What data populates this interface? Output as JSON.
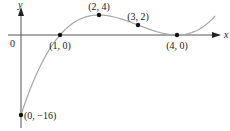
{
  "chart_data": {
    "type": "line",
    "title": "",
    "xlabel": "x",
    "ylabel": "y",
    "function": "f(x) = (x - 1)(x - 4)^2",
    "origin_label": "0",
    "x_range": [
      0,
      5
    ],
    "y_range": [
      -16,
      4
    ],
    "grid": false,
    "legend": "none",
    "points": [
      {
        "x": 0,
        "y": -16,
        "label": "(0, −16)"
      },
      {
        "x": 1,
        "y": 0,
        "label": "(1, 0)"
      },
      {
        "x": 2,
        "y": 4,
        "label": "(2, 4)"
      },
      {
        "x": 3,
        "y": 2,
        "label": "(3, 2)"
      },
      {
        "x": 4,
        "y": 0,
        "label": "(4, 0)"
      }
    ],
    "curve_color": "#a8a8a8",
    "axis_color": "#555555",
    "point_color": "#111111"
  }
}
